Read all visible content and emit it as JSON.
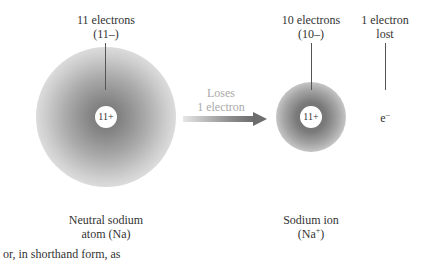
{
  "atom": {
    "label_top_line1": "11 electrons",
    "label_top_line2": "(11–)",
    "nucleus": "11+",
    "name_line1": "Neutral sodium",
    "name_line2": "atom (Na)"
  },
  "process": {
    "line1": "Loses",
    "line2": "1 electron",
    "arrow_icon": "right-arrow-icon"
  },
  "ion": {
    "label_top_line1": "10 electrons",
    "label_top_line2": "(10–)",
    "nucleus": "11+",
    "name_line1": "Sodium ion",
    "name_line2_prefix": "(Na",
    "name_line2_sup": "+",
    "name_line2_suffix": ")"
  },
  "lost_electron": {
    "label_line1": "1 electron",
    "label_line2": "lost",
    "symbol": "e",
    "symbol_sup": "–"
  },
  "footer_text": "or, in shorthand form, as"
}
